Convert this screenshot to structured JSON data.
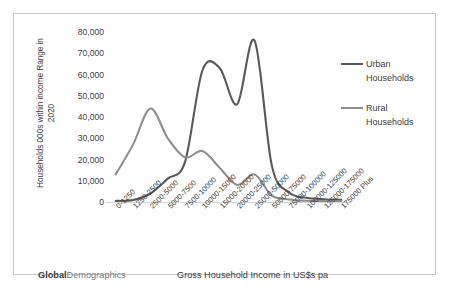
{
  "brand": {
    "bold": "Global",
    "rest": "Demographics"
  },
  "axis": {
    "y_title_line1": "Households 000s within income Range in",
    "y_title_line2": "2020",
    "x_title": "Gross Household Income in US$s pa"
  },
  "legend": {
    "position": "right",
    "entries": [
      {
        "label_line1": "Urban",
        "label_line2": "Households",
        "color": "#595959"
      },
      {
        "label_line1": "Rural",
        "label_line2": "Households",
        "color": "#8f8f8f"
      }
    ]
  },
  "chart_data": {
    "type": "line",
    "title": "",
    "xlabel": "Gross Household Income in US$s pa",
    "ylabel": "Households 000s within income Range in 2020",
    "ylim": [
      0,
      80000
    ],
    "yticks": [
      0,
      10000,
      20000,
      30000,
      40000,
      50000,
      60000,
      70000,
      80000
    ],
    "ytick_labels": [
      "0",
      "10,000",
      "20,000",
      "30,000",
      "40,000",
      "50,000",
      "60,000",
      "70,000",
      "80,000"
    ],
    "grid": false,
    "categories": [
      "0-1250",
      "1250-2500",
      "2500-5000",
      "5000-7500",
      "7500-10000",
      "10000-15000",
      "15000-20000",
      "20000-25000",
      "25000-50000",
      "50000-75000",
      "75000-100000",
      "100000-125000",
      "125000-175000",
      "175000 Plus"
    ],
    "series": [
      {
        "name": "Urban Households",
        "color": "#595959",
        "values": [
          500,
          900,
          4000,
          11000,
          19000,
          62000,
          63000,
          46000,
          76000,
          17000,
          4500,
          2000,
          1300,
          1000
        ]
      },
      {
        "name": "Rural Households",
        "color": "#8f8f8f",
        "values": [
          13000,
          27000,
          44000,
          30000,
          21000,
          24000,
          16000,
          8000,
          13000,
          3000,
          1200,
          600,
          400,
          300
        ]
      }
    ]
  }
}
